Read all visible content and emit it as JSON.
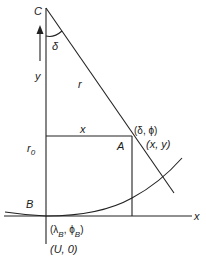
{
  "diagram": {
    "type": "geometric-construction",
    "points": {
      "C": {
        "label": "C"
      },
      "A": {
        "label": "A",
        "coords_polar": "(δ, ϕ)",
        "coords_cartesian": "(x, y)"
      },
      "B": {
        "label": "B",
        "coords_polar_prefix": "(λ",
        "coords_polar_sub1": "B",
        "coords_polar_mid": ", ϕ",
        "coords_polar_sub2": "B",
        "coords_polar_suffix": ")",
        "coords_cartesian": "(U, 0)"
      }
    },
    "labels": {
      "angle": "δ",
      "radius": "r",
      "y_axis": "y",
      "x_segment": "x",
      "r0": "r",
      "r0_sub": "0",
      "x_axis": "x"
    },
    "colors": {
      "line": "#222222",
      "text": "#1a1a1a",
      "background": "#ffffff"
    }
  }
}
